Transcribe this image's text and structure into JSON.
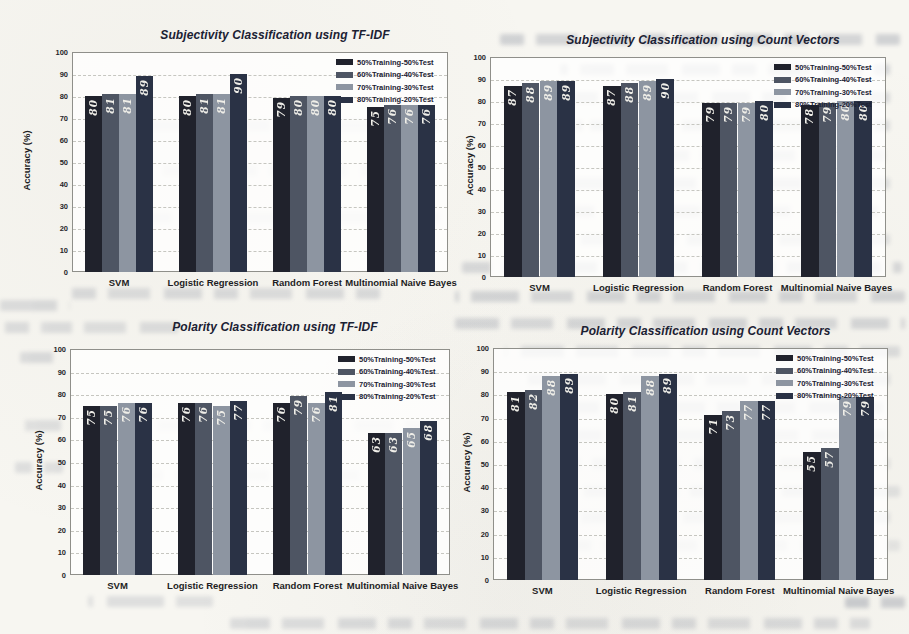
{
  "style": {
    "series_colors": [
      "#20222c",
      "#4e5563",
      "#8d95a1",
      "#2a3245"
    ],
    "value_label_color": "#efeee8",
    "title_color": "#1b2133",
    "axis_text_color": "#26262a",
    "gridline_color": "#c6c6c0",
    "plot_border_color": "#8f8f8a",
    "page_background": "#f7f6f1"
  },
  "chart_data": [
    {
      "type": "bar",
      "title": "Subjectivity Classification using TF-IDF",
      "ylabel": "Accuracy (%)",
      "xlabel": "",
      "ylim": [
        0,
        100
      ],
      "yticks": [
        0,
        10,
        20,
        30,
        40,
        50,
        60,
        70,
        80,
        90,
        100
      ],
      "grid": true,
      "legend_position": "top-right",
      "categories": [
        "SVM",
        "Logistic Regression",
        "Random Forest",
        "Multinomial Naive Bayes"
      ],
      "series": [
        {
          "name": "50%Training-50%Test",
          "values": [
            80,
            80,
            79,
            75
          ]
        },
        {
          "name": "60%Training-40%Test",
          "values": [
            81,
            81,
            80,
            76
          ]
        },
        {
          "name": "70%Training-30%Test",
          "values": [
            81,
            81,
            80,
            76
          ]
        },
        {
          "name": "80%Training-20%Test",
          "values": [
            89,
            90,
            80,
            76
          ]
        }
      ]
    },
    {
      "type": "bar",
      "title": "Subjectivity Classification using Count Vectors",
      "ylabel": "Accuracy (%)",
      "xlabel": "",
      "ylim": [
        0,
        100
      ],
      "yticks": [
        0,
        10,
        20,
        30,
        40,
        50,
        60,
        70,
        80,
        90,
        100
      ],
      "grid": true,
      "legend_position": "top-right",
      "categories": [
        "SVM",
        "Logistic Regression",
        "Random Forest",
        "Multinomial Naive Bayes"
      ],
      "series": [
        {
          "name": "50%Training-50%Test",
          "values": [
            87,
            87,
            79,
            78
          ]
        },
        {
          "name": "60%Training-40%Test",
          "values": [
            88,
            88,
            79,
            79
          ]
        },
        {
          "name": "70%Training-30%Test",
          "values": [
            89,
            89,
            79,
            80
          ]
        },
        {
          "name": "80%Training-20%Test",
          "values": [
            89,
            90,
            80,
            80
          ]
        }
      ]
    },
    {
      "type": "bar",
      "title": "Polarity Classification using TF-IDF",
      "ylabel": "Accuracy (%)",
      "xlabel": "",
      "ylim": [
        0,
        100
      ],
      "yticks": [
        0,
        10,
        20,
        30,
        40,
        50,
        60,
        70,
        80,
        90,
        100
      ],
      "grid": true,
      "legend_position": "top-right",
      "categories": [
        "SVM",
        "Logistic Regression",
        "Random Forest",
        "Multinomial Naive Bayes"
      ],
      "series": [
        {
          "name": "50%Training-50%Test",
          "values": [
            75,
            76,
            76,
            63
          ]
        },
        {
          "name": "60%Training-40%Test",
          "values": [
            75,
            76,
            79,
            63
          ]
        },
        {
          "name": "70%Training-30%Test",
          "values": [
            76,
            75,
            76,
            65
          ]
        },
        {
          "name": "80%Training-20%Test",
          "values": [
            76,
            77,
            81,
            68
          ]
        }
      ]
    },
    {
      "type": "bar",
      "title": "Polarity Classification using Count Vectors",
      "ylabel": "Accuracy (%)",
      "xlabel": "",
      "ylim": [
        0,
        100
      ],
      "yticks": [
        0,
        10,
        20,
        30,
        40,
        50,
        60,
        70,
        80,
        90,
        100
      ],
      "grid": true,
      "legend_position": "top-right",
      "categories": [
        "SVM",
        "Logistic Regression",
        "Random Forest",
        "Multinomial Naive Bayes"
      ],
      "series": [
        {
          "name": "50%Training-50%Test",
          "values": [
            81,
            80,
            71,
            55
          ]
        },
        {
          "name": "60%Training-40%Test",
          "values": [
            82,
            81,
            73,
            57
          ]
        },
        {
          "name": "70%Training-30%Test",
          "values": [
            88,
            88,
            77,
            79
          ]
        },
        {
          "name": "80%Training-20%Test",
          "values": [
            89,
            89,
            77,
            79
          ]
        }
      ]
    }
  ]
}
